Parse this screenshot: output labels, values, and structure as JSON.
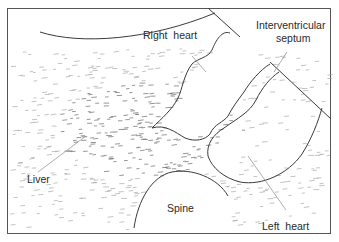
{
  "diagram": {
    "type": "anatomical-ultrasound-sketch",
    "labels": {
      "right_heart": "Right  heart",
      "interventricular_line1": "Interventricular",
      "interventricular_line2": "septum",
      "liver": "Liver",
      "spine": "Spine",
      "left_heart": "Left  heart"
    },
    "colors": {
      "ink": "#3a3a3a",
      "texture": "#9a9a9a",
      "background": "#ffffff"
    }
  }
}
